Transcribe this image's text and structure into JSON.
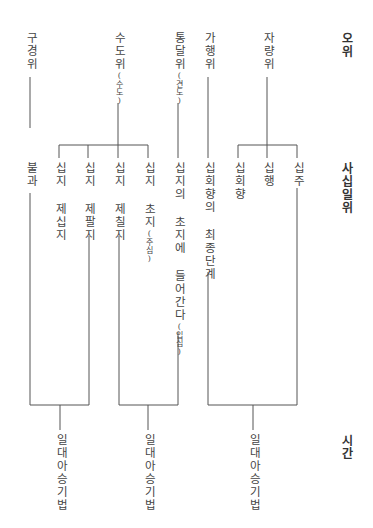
{
  "row_labels": {
    "five_stages": "오위",
    "forty_one_stages": "사십일위",
    "time": "시간"
  },
  "five_stages": [
    {
      "label": "구경위",
      "note": ""
    },
    {
      "label": "수도위",
      "note": "(수도)"
    },
    {
      "label": "통달위",
      "note": "(견도)"
    },
    {
      "label": "가행위",
      "note": ""
    },
    {
      "label": "자량위",
      "note": ""
    }
  ],
  "forty_one_stages": [
    {
      "label": "불과",
      "note": ""
    },
    {
      "label": "십지 제십지",
      "note": ""
    },
    {
      "label": "십지 제팔지",
      "note": ""
    },
    {
      "label": "십지 제칠지",
      "note": ""
    },
    {
      "label": "십지 초지",
      "note": "(주심)"
    },
    {
      "label": "십지의 초지에 들어간다",
      "note": "(입심)"
    },
    {
      "label": "십회향의 최종단계",
      "note": ""
    },
    {
      "label": "십회향",
      "note": ""
    },
    {
      "label": "십행",
      "note": ""
    },
    {
      "label": "십주",
      "note": ""
    }
  ],
  "time": [
    {
      "label": "일대아승기법"
    },
    {
      "label": "일대아승기법"
    },
    {
      "label": "일대아승기법"
    }
  ]
}
